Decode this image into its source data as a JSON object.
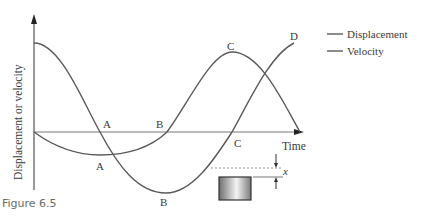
{
  "figure": {
    "caption": "Figure 6.5",
    "axes": {
      "y_label": "Displacement or velocity",
      "x_label": "Time"
    },
    "legend": {
      "items": [
        {
          "label": "Displacement"
        },
        {
          "label": "Velocity"
        }
      ]
    },
    "point_labels": {
      "displacement_curve": [
        "A",
        "B",
        "C",
        "D"
      ],
      "velocity_curve": [
        "A",
        "B",
        "C"
      ]
    },
    "inset": {
      "dimension_label": "x"
    }
  },
  "colors": {
    "curve": "#5a5a5a",
    "axis": "#555555",
    "text": "#3a3a3a",
    "caption": "#6b6b6b"
  }
}
